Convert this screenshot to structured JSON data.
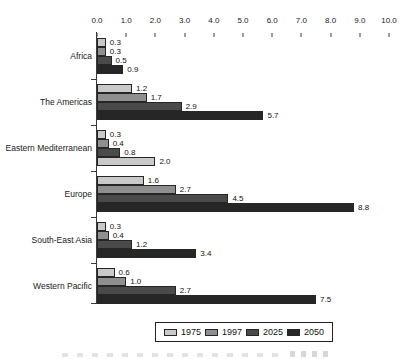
{
  "chart_data": {
    "type": "bar",
    "orientation": "horizontal",
    "title": "",
    "xlabel": "",
    "ylabel": "",
    "xlim": [
      0,
      10
    ],
    "x_ticks": [
      "0.0",
      "1.0",
      "2.0",
      "3.0",
      "4.0",
      "5.0",
      "6.0",
      "7.0",
      "8.0",
      "9.0",
      "10.0"
    ],
    "axis_position": "top",
    "grid": false,
    "value_labels_shown": true,
    "categories": [
      "Africa",
      "The Americas",
      "Eastern Mediterranean",
      "Europe",
      "South-East Asia",
      "Western Pacific"
    ],
    "series": [
      {
        "name": "1975",
        "color": "#c9c9c9",
        "values": [
          0.3,
          1.2,
          0.3,
          1.6,
          0.3,
          0.6
        ]
      },
      {
        "name": "1997",
        "color": "#8f8f8f",
        "values": [
          0.3,
          1.7,
          0.4,
          2.7,
          0.4,
          1.0
        ]
      },
      {
        "name": "2025",
        "color": "#4a4a4a",
        "values": [
          0.5,
          2.9,
          0.8,
          4.5,
          1.2,
          2.7
        ]
      },
      {
        "name": "2050",
        "color": "#262626",
        "values": [
          0.9,
          5.7,
          2.0,
          8.8,
          3.4,
          7.5
        ]
      }
    ],
    "bar_color_overrides": [
      {
        "category": "Eastern Mediterranean",
        "series": "2050",
        "rendered_color": "#c9c9c9"
      }
    ],
    "legend": {
      "position": "bottom",
      "entries": [
        "1975",
        "1997",
        "2025",
        "2050"
      ]
    }
  }
}
